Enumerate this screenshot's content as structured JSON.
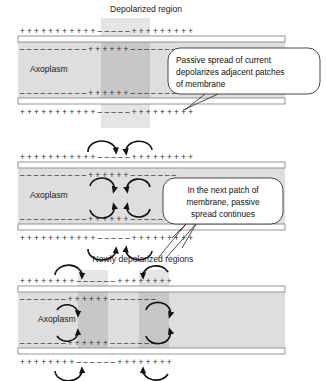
{
  "figure": {
    "title_top": "Depolarized region",
    "title_bottom": "Newly depolarized regions",
    "axoplasm_label": "Axoplasm",
    "charge_positive": "+",
    "charge_negative": "–"
  },
  "colors": {
    "background": "#ffffff",
    "axoplasm_fill": "#dedede",
    "depolarized_fill": "#c4c4c4",
    "membrane_line": "#7a7a7a",
    "membrane_inner": "#ffffff",
    "text": "#1a1a1a",
    "arrow": "#111111",
    "callout_border": "#333333",
    "callout_fill": "#ffffff"
  },
  "panels": [
    {
      "id": "panel-1",
      "name": "single-depolarized-patch",
      "axoplasm_label": "Axoplasm",
      "heading": "Depolarized region",
      "depolarized_regions": [
        {
          "x": 101,
          "y": 18,
          "width": 49,
          "height": 110
        }
      ],
      "outer_top_charges": "+ + + + + + + + + + + – – – – – + + + + + + + + +",
      "inner_top_charges": "– – – – – – – – – – + + + + + + – – – – – – –",
      "inner_bottom_charges": "– – – – – – – – – – + + + + + + – – – – – – –",
      "outer_bottom_charges": "+ + + + + + + + + + + – – – – – + + + + + + + + +"
    },
    {
      "id": "panel-2",
      "name": "passive-spread-next-patch",
      "axoplasm_label": "Axoplasm",
      "depolarized_regions": [],
      "outer_top_charges": "+ + + + + + + + + + + – – – – – + + + + + + + + +",
      "inner_top_charges": "– – – – – – – – – – + + + + + + – – – – – – –",
      "inner_bottom_charges": "– – – – – – – – – – + + + + + + – – – – – – –",
      "outer_bottom_charges": "+ + + + + + + + + + + – – – – – + + + + + + + + +"
    },
    {
      "id": "panel-3",
      "name": "two-new-depolarized-patches",
      "axoplasm_label": "Axoplasm",
      "heading": "Newly depolarized regions",
      "depolarized_regions": [
        {
          "x": 78,
          "y": 270,
          "width": 30,
          "height": 82
        },
        {
          "x": 139,
          "y": 270,
          "width": 30,
          "height": 82
        }
      ],
      "outer_top_charges": "+ + + + + + + + – – – – – – + + + + + + + +",
      "inner_top_charges": "– – – – – – – + + + + + + – – – – – – –",
      "inner_bottom_charges": "– – – – – – – + + + + + + – – – – – – –",
      "outer_bottom_charges": "+ + + + + + + + – – – – – – + + + + + + + +"
    }
  ],
  "callouts": [
    {
      "id": "callout-1",
      "name": "passive-spread-callout",
      "lines": [
        "Passive spread of current",
        "depolarizes adjacent patches",
        "of membrane"
      ],
      "x": 168,
      "y": 48,
      "width": 152,
      "height": 46
    },
    {
      "id": "callout-2",
      "name": "next-patch-callout",
      "lines": [
        "In the next patch of",
        "membrane, passive",
        "spread continues"
      ],
      "x": 163,
      "y": 178,
      "width": 120,
      "height": 46
    }
  ]
}
